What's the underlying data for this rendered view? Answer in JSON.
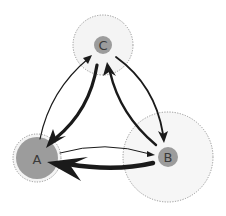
{
  "diagram": {
    "type": "directed-graph",
    "colors": {
      "background": "#ffffff",
      "halo_fill": "#f4f4f4",
      "halo_stroke": "#8a8a8a",
      "node_fill": "#9c9c9c",
      "edge": "#1a1a1a",
      "label": "#3a3a3a"
    },
    "nodes": [
      {
        "id": "A",
        "label": "A",
        "cx": 37,
        "cy": 158,
        "r": 21,
        "halo_r": 24
      },
      {
        "id": "B",
        "label": "B",
        "cx": 168,
        "cy": 157,
        "r": 10,
        "halo_r": 45
      },
      {
        "id": "C",
        "label": "C",
        "cx": 103,
        "cy": 45,
        "r": 9,
        "halo_r": 30
      }
    ],
    "edges": [
      {
        "from": "A",
        "to": "C",
        "weight": "thin",
        "stroke_width": 1.2
      },
      {
        "from": "C",
        "to": "A",
        "weight": "thick",
        "stroke_width": 3.2
      },
      {
        "from": "C",
        "to": "B",
        "weight": "medium",
        "stroke_width": 1.8
      },
      {
        "from": "B",
        "to": "C",
        "weight": "medium-thick",
        "stroke_width": 2.4
      },
      {
        "from": "A",
        "to": "B",
        "weight": "thin",
        "stroke_width": 1.0
      },
      {
        "from": "B",
        "to": "A",
        "weight": "very-thick",
        "stroke_width": 4.5
      }
    ]
  }
}
